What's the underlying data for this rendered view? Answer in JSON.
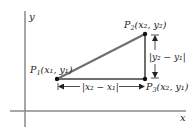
{
  "diagram": {
    "type": "distance-formula-coordinate-diagram",
    "axes": {
      "x_label": "x",
      "y_label": "y"
    },
    "points": [
      {
        "id": "P1",
        "name": "P",
        "sub": "1",
        "coords": "(x₁, y₁)",
        "label": "P₁(x₁, y₁)"
      },
      {
        "id": "P2",
        "name": "P",
        "sub": "2",
        "coords": "(x₂, y₂)",
        "label": "P₂(x₂, y₂)"
      },
      {
        "id": "P3",
        "name": "P",
        "sub": "3",
        "coords": "(x₂, y₁)",
        "label": "P₃(x₂, y₁)"
      }
    ],
    "measurements": {
      "horizontal": "|x₂ − x₁|",
      "vertical": "|y₂ − y₁|"
    },
    "colors": {
      "axis": "#8a8a8a",
      "triangle": "#6f6f6f",
      "point": "#111111",
      "text": "#222222"
    }
  }
}
